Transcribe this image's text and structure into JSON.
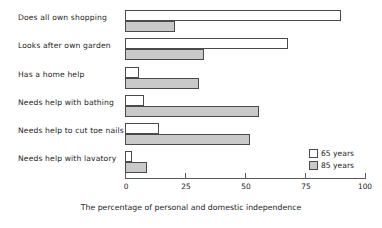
{
  "chart_data": {
    "type": "bar",
    "orientation": "horizontal",
    "title": "",
    "xlabel": "The percentage of personal and domestic independence",
    "ylabel": "",
    "xlim": [
      0,
      100
    ],
    "xticks": [
      0,
      25,
      50,
      75,
      100
    ],
    "xtick_labels": [
      "0",
      "25",
      "50",
      "75",
      "100"
    ],
    "grid": false,
    "legend_position": "bottom-right",
    "categories": [
      "Does all own shopping",
      "Looks after own garden",
      "Has a home help",
      "Needs help with bathing",
      "Needs help to cut toe nails",
      "Needs help with lavatory"
    ],
    "series": [
      {
        "name": "65 years",
        "color": "#ffffff",
        "edge_color": "#4a4a4a",
        "values": [
          90,
          68,
          6,
          8,
          14,
          3
        ]
      },
      {
        "name": "85 years",
        "color": "#c9c9c9",
        "edge_color": "#4a4a4a",
        "values": [
          21,
          33,
          31,
          56,
          52,
          9
        ]
      }
    ]
  },
  "legend": {
    "items": [
      {
        "label": "65 years"
      },
      {
        "label": "85 years"
      }
    ]
  },
  "axis": {
    "x_title": "The percentage of personal and domestic independence",
    "tick_labels": [
      "0",
      "25",
      "50",
      "75",
      "100"
    ]
  },
  "colors": {
    "series_65": "#ffffff",
    "series_85": "#c9c9c9",
    "outline": "#4a4a4a",
    "axis": "#5a5a5a",
    "text": "#1d1d1d",
    "background": "#ffffff"
  }
}
